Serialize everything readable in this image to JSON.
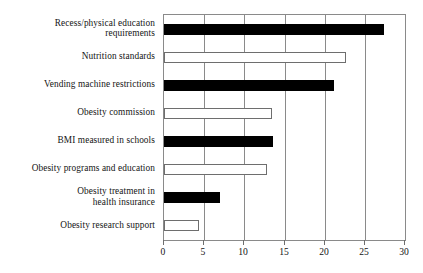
{
  "chart_data": {
    "type": "bar",
    "orientation": "horizontal",
    "title": "",
    "subtitle": "",
    "xlabel": "",
    "ylabel": "",
    "xlim": [
      0,
      30
    ],
    "ylim": null,
    "grid": true,
    "legend": null,
    "legend_position": "none",
    "xticks": [
      0,
      5,
      10,
      15,
      20,
      25,
      30
    ],
    "xtick_labels": [
      "0",
      "5",
      "10",
      "15",
      "20",
      "25",
      "30"
    ],
    "categories": [
      "Recess/physical education\nrequirements",
      "Nutrition standards",
      "Vending machine restrictions",
      "Obesity commission",
      "BMI measured in schools",
      "Obesity programs and education",
      "Obesity treatment in\nhealth insurance",
      "Obesity research support"
    ],
    "values": [
      27.4,
      22.6,
      21.1,
      13.5,
      13.6,
      12.8,
      7.0,
      4.4
    ],
    "bar_styles": [
      "filled",
      "hollow",
      "filled",
      "hollow",
      "filled",
      "hollow",
      "filled",
      "hollow"
    ],
    "colors": {
      "filled": "#000000",
      "hollow_fill": "#ffffff",
      "hollow_stroke": "#6e6e6e",
      "axis": "#8a8a8a",
      "grid": "#8a8a8a",
      "text": "#141414",
      "background": "#ffffff"
    }
  }
}
